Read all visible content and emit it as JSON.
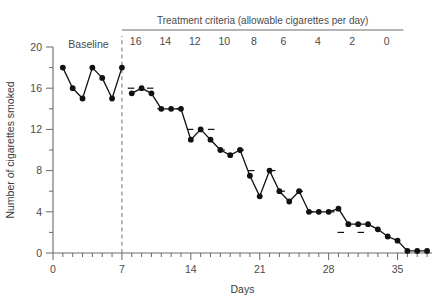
{
  "chart_data": {
    "type": "line",
    "title": "",
    "xlabel": "Days",
    "ylabel": "Number of cigarettes smoked",
    "xlim": [
      0,
      38.5
    ],
    "ylim": [
      0,
      20
    ],
    "xticks": [
      0,
      7,
      14,
      21,
      28,
      35
    ],
    "xtick_labels": [
      "0",
      "7",
      "14",
      "21",
      "28",
      "35"
    ],
    "x_minor_tick_step": 1,
    "yticks": [
      0,
      4,
      8,
      12,
      16,
      20
    ],
    "ytick_labels": [
      "0",
      "4",
      "8",
      "12",
      "16",
      "20"
    ],
    "y_minor_tick_step": 2,
    "grid": false,
    "legend": "none",
    "phase_header": "Treatment criteria (allowable cigarettes per day)",
    "baseline_label": "Baseline",
    "phase_divider_x": 7,
    "criteria_labels": [
      "16",
      "14",
      "12",
      "10",
      "8",
      "6",
      "4",
      "2",
      "0"
    ],
    "criteria_label_x": [
      8.4,
      11.4,
      14.4,
      17.4,
      20.4,
      23.4,
      26.9,
      30.4,
      33.9
    ],
    "criterion_levels": [
      {
        "criterion": 16,
        "x_start": 7.6,
        "x_end": 10.2,
        "y": 16
      },
      {
        "criterion": 14,
        "x_start": 10.6,
        "x_end": 13.2,
        "y": 14
      },
      {
        "criterion": 12,
        "x_start": 13.6,
        "x_end": 16.4,
        "y": 12
      },
      {
        "criterion": 10,
        "x_start": 16.8,
        "x_end": 19.4,
        "y": 10
      },
      {
        "criterion": 8,
        "x_start": 19.8,
        "x_end": 22.6,
        "y": 8
      },
      {
        "criterion": 6,
        "x_start": 22.9,
        "x_end": 25.4,
        "y": 6
      },
      {
        "criterion": 4,
        "x_start": 25.8,
        "x_end": 28.6,
        "y": 4
      },
      {
        "criterion": 2,
        "x_start": 28.9,
        "x_end": 31.6,
        "y": 2
      },
      {
        "criterion": 0,
        "x_start": 32.2,
        "x_end": 34.6,
        "y": 0
      }
    ],
    "series": [
      {
        "name": "Baseline",
        "phase": "baseline",
        "x": [
          1,
          2,
          3,
          4,
          5,
          6,
          7
        ],
        "values": [
          18,
          16,
          15,
          18,
          17,
          15,
          18
        ]
      },
      {
        "name": "Treatment",
        "phase": "treatment",
        "x": [
          8,
          9,
          10,
          11,
          12,
          13,
          14,
          15,
          16,
          17,
          18,
          19,
          20,
          21,
          22,
          23,
          24,
          25,
          26,
          27,
          28,
          29,
          30,
          31,
          32,
          33,
          34,
          35,
          36,
          37,
          38
        ],
        "values": [
          15.5,
          16,
          15.5,
          14,
          14,
          14,
          11,
          12,
          11,
          10,
          9.5,
          10,
          7.5,
          5.5,
          8,
          6,
          5,
          6,
          4,
          4,
          4,
          4.3,
          2.8,
          2.8,
          2.8,
          2.3,
          1.6,
          1.2,
          0.2,
          0.2,
          0.2
        ]
      }
    ]
  },
  "axes": {
    "x_axis_name": "Days",
    "y_axis_name": "Number of cigarettes smoked"
  }
}
